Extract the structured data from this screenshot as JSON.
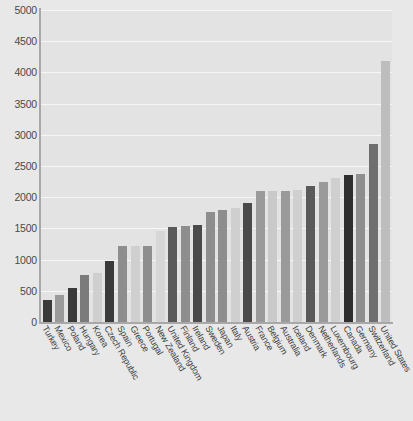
{
  "chart": {
    "title": "",
    "title_note": "title cut off at top edge of screenshot",
    "ylabel": "",
    "xlabel": ""
  },
  "chart_data": {
    "type": "bar",
    "title": "",
    "xlabel": "",
    "ylabel": "",
    "ylim": [
      0,
      5000
    ],
    "ytick_step": 500,
    "grid": true,
    "legend": "none",
    "yticks": [
      "0",
      "500",
      "1000",
      "1500",
      "2000",
      "2500",
      "3000",
      "3500",
      "4000",
      "4500",
      "5000"
    ],
    "categories": [
      "Turkey",
      "Mexico",
      "Poland",
      "Hungary",
      "Korea",
      "Czech Republic",
      "Spain",
      "Greece",
      "Portugal",
      "New Zealand",
      "United Kingdom",
      "Finland",
      "Ireland",
      "Sweden",
      "Japan",
      "Italy",
      "Austria",
      "France",
      "Belgium",
      "Australia",
      "Iceland",
      "Denmark",
      "Netherlands",
      "Luxembourg",
      "Canada",
      "Germany",
      "Switzerland",
      "United States"
    ],
    "values": [
      350,
      440,
      550,
      760,
      780,
      970,
      1220,
      1220,
      1220,
      1460,
      1530,
      1540,
      1560,
      1770,
      1800,
      1830,
      1910,
      2100,
      2100,
      2100,
      2120,
      2180,
      2250,
      2310,
      2350,
      2370,
      2850,
      4180
    ],
    "bar_colors": [
      "#3a3a3a",
      "#9a9a9a",
      "#3a3a3a",
      "#7b7b7b",
      "#cfcfcf",
      "#3a3a3a",
      "#8e8e8e",
      "#cfcfcf",
      "#8e8e8e",
      "#d6d6d6",
      "#5a5a5a",
      "#8e8e8e",
      "#4a4a4a",
      "#8e8e8e",
      "#8e8e8e",
      "#cfcfcf",
      "#4a4a4a",
      "#9a9a9a",
      "#c9c9c9",
      "#9a9a9a",
      "#cfcfcf",
      "#5a5a5a",
      "#9a9a9a",
      "#cfcfcf",
      "#2e2e2e",
      "#8e8e8e",
      "#6f6f6f",
      "#bdbdbd"
    ]
  },
  "colors": {
    "page_background": "#e8e8e8",
    "plot_background": "#e3e3e3",
    "gridline": "#f6f6f6",
    "axis": "#a8a8a8",
    "tick_text": "#4a4a4a",
    "label_text": "#3f3f3f"
  }
}
